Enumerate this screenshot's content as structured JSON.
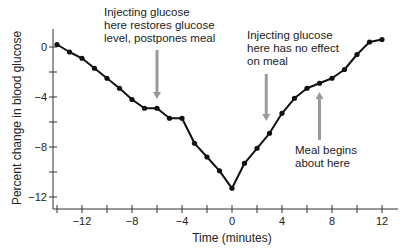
{
  "chart_data": {
    "type": "line",
    "title": "",
    "xlabel": "Time (minutes)",
    "ylabel": "Percent change in blood glucose",
    "xlim": [
      -14,
      12.5
    ],
    "ylim": [
      -13,
      1
    ],
    "x_ticks": [
      -14,
      -12,
      -10,
      -8,
      -6,
      -4,
      -2,
      0,
      2,
      4,
      6,
      8,
      10,
      12
    ],
    "x_tick_labels": [
      "-12",
      "-8",
      "-4",
      "0",
      "4",
      "8",
      "12"
    ],
    "x_tick_label_values": [
      -12,
      -8,
      -4,
      0,
      4,
      8,
      12
    ],
    "y_ticks": [
      0,
      -2,
      -4,
      -6,
      -8,
      -10,
      -12
    ],
    "y_tick_labels": [
      "0",
      "−4",
      "−8",
      "−12"
    ],
    "y_tick_label_values": [
      0,
      -4,
      -8,
      -12
    ],
    "grid": false,
    "legend": null,
    "series": [
      {
        "name": "Blood glucose",
        "color": "#111111",
        "x": [
          -14,
          -13,
          -12,
          -11,
          -10,
          -9,
          -8,
          -7,
          -6,
          -5,
          -4,
          -3,
          -2,
          -1,
          0,
          1,
          2,
          3,
          4,
          5,
          6,
          7,
          8,
          9,
          10,
          11,
          12
        ],
        "values": [
          0.2,
          -0.4,
          -0.9,
          -1.7,
          -2.5,
          -3.3,
          -4.2,
          -4.9,
          -4.9,
          -5.7,
          -5.7,
          -7.7,
          -8.8,
          -9.9,
          -11.3,
          -9.3,
          -8.1,
          -6.9,
          -5.3,
          -4.1,
          -3.3,
          -2.9,
          -2.5,
          -1.8,
          -0.6,
          0.4,
          0.6
        ]
      }
    ],
    "annotations": [
      {
        "text": "Injecting glucose\nhere restores glucose\nlevel, postpones meal",
        "arrow": "down",
        "arrow_x": -6,
        "color": "#9a9a9a"
      },
      {
        "text": "Injecting glucose\nhere has no effect\non meal",
        "arrow": "down",
        "arrow_x": 2.7,
        "color": "#9a9a9a"
      },
      {
        "text": "Meal begins\nabout here",
        "arrow": "up",
        "arrow_x": 7,
        "color": "#9a9a9a"
      }
    ]
  }
}
